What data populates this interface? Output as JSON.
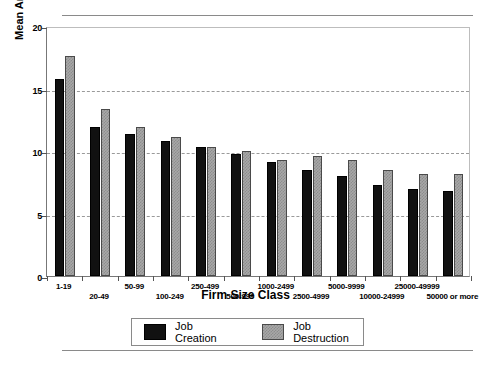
{
  "chart_data": {
    "type": "bar",
    "title": "",
    "xlabel": "Firm Size Class",
    "ylabel": "Mean Annual Rates, 1973-1988",
    "ylim": [
      0,
      20
    ],
    "yticks": [
      0,
      5,
      10,
      15,
      20
    ],
    "grid": "horizontal-dashed-at-5-10-15",
    "legend_position": "below-plot-centered",
    "categories": [
      "1-19",
      "20-49",
      "50-99",
      "100-249",
      "250-499",
      "500-999",
      "1000-2499",
      "2500-4999",
      "5000-9999",
      "10000-24999",
      "25000-49999",
      "50000 or more"
    ],
    "series": [
      {
        "name": "Job Creation",
        "color": "#111111",
        "values": [
          15.8,
          11.9,
          11.4,
          10.8,
          10.3,
          9.8,
          9.1,
          8.5,
          8.0,
          7.3,
          7.0,
          6.8
        ]
      },
      {
        "name": "Job Destruction",
        "color": "#a8a8a8",
        "values": [
          17.6,
          13.4,
          11.9,
          11.1,
          10.3,
          10.0,
          9.3,
          9.6,
          9.3,
          8.5,
          8.2,
          8.2
        ]
      }
    ]
  },
  "legend": {
    "items": [
      {
        "label": "Job Creation",
        "swatch": "creation"
      },
      {
        "label": "Job Destruction",
        "swatch": "destruction"
      }
    ]
  }
}
